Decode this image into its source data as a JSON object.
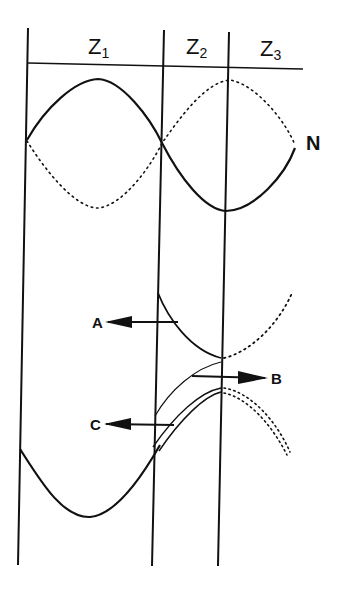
{
  "diagram": {
    "zones": [
      {
        "label": "Z",
        "sub": "1"
      },
      {
        "label": "Z",
        "sub": "2"
      },
      {
        "label": "Z",
        "sub": "3"
      }
    ],
    "curve_label": "N",
    "arrows": [
      {
        "label": "A",
        "direction": "left"
      },
      {
        "label": "B",
        "direction": "right"
      },
      {
        "label": "C",
        "direction": "left"
      }
    ],
    "colors": {
      "ink": "#111111",
      "background": "#ffffff"
    }
  }
}
